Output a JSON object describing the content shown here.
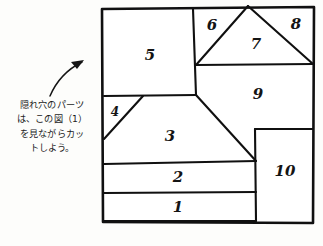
{
  "page": {
    "background_color": "#fdfdfb",
    "ink_color": "#101010",
    "width": 323,
    "height": 246
  },
  "caption": {
    "name": "instruction-caption",
    "lines": [
      "隠れ穴のパーツ",
      "は、この図（1）",
      "を見ながらカッ",
      "トしよう。"
    ],
    "full_text": "隠れ穴のパーツは、この図（1）を見ながらカットしよう。"
  },
  "arrow": {
    "name": "curved-pointer-arrow",
    "direction": "up-right",
    "from": [
      50,
      96
    ],
    "to": [
      84,
      60
    ]
  },
  "diagram": {
    "name": "cut-layout-diagram",
    "outer_frame": [
      [
        102,
        9
      ],
      [
        314,
        7
      ],
      [
        313,
        223
      ],
      [
        103,
        222
      ]
    ],
    "part_count": 10,
    "parts": [
      {
        "id": 1,
        "label": "1",
        "shape": "strip",
        "label_pos": [
          178,
          208
        ],
        "points": [
          [
            104,
            193
          ],
          [
            256,
            192
          ],
          [
            256,
            221
          ],
          [
            104,
            221
          ]
        ]
      },
      {
        "id": 2,
        "label": "2",
        "shape": "strip",
        "label_pos": [
          178,
          178
        ],
        "points": [
          [
            104,
            164
          ],
          [
            256,
            161
          ],
          [
            256,
            192
          ],
          [
            104,
            193
          ]
        ]
      },
      {
        "id": 3,
        "label": "3",
        "shape": "trapezoid",
        "label_pos": [
          170,
          137
        ],
        "points": [
          [
            104,
            139
          ],
          [
            143,
            96
          ],
          [
            196,
            95
          ],
          [
            256,
            161
          ],
          [
            104,
            164
          ]
        ]
      },
      {
        "id": 4,
        "label": "4",
        "shape": "triangle",
        "label_pos": [
          115,
          112
        ],
        "points": [
          [
            104,
            96
          ],
          [
            143,
            96
          ],
          [
            104,
            139
          ]
        ]
      },
      {
        "id": 5,
        "label": "5",
        "shape": "rectangle",
        "label_pos": [
          150,
          56
        ],
        "points": [
          [
            102,
            9
          ],
          [
            193,
            9
          ],
          [
            196,
            95
          ],
          [
            104,
            96
          ]
        ]
      },
      {
        "id": 6,
        "label": "6",
        "shape": "triangle",
        "label_pos": [
          212,
          26
        ],
        "points": [
          [
            193,
            9
          ],
          [
            248,
            6
          ],
          [
            196,
            65
          ]
        ]
      },
      {
        "id": 7,
        "label": "7",
        "shape": "triangle",
        "label_pos": [
          256,
          45
        ],
        "points": [
          [
            248,
            6
          ],
          [
            313,
            64
          ],
          [
            196,
            65
          ]
        ]
      },
      {
        "id": 8,
        "label": "8",
        "shape": "triangle",
        "label_pos": [
          296,
          25
        ],
        "points": [
          [
            248,
            6
          ],
          [
            314,
            7
          ],
          [
            313,
            64
          ]
        ]
      },
      {
        "id": 9,
        "label": "9",
        "shape": "pentagon",
        "label_pos": [
          258,
          95
        ],
        "points": [
          [
            196,
            65
          ],
          [
            313,
            64
          ],
          [
            313,
            129
          ],
          [
            255,
            129
          ],
          [
            256,
            161
          ],
          [
            196,
            95
          ]
        ]
      },
      {
        "id": 10,
        "label": "10",
        "shape": "rectangle",
        "label_pos": [
          285,
          172
        ],
        "points": [
          [
            255,
            129
          ],
          [
            313,
            129
          ],
          [
            313,
            221
          ],
          [
            255,
            221
          ]
        ]
      }
    ]
  }
}
